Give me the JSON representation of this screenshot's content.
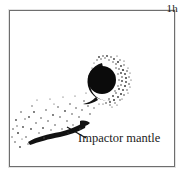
{
  "panel": {
    "kind": "impact-simulation-snapshot",
    "background_color": "#ffffff",
    "frame_color": "#6e6e6e",
    "ink_color": "#111111"
  },
  "time_label": {
    "text": "1h"
  },
  "annotation": {
    "label": "Impactor mantle",
    "leader_line": "points from the label up-left to the dark elongated streak"
  },
  "features": {
    "core": {
      "name": "target-core",
      "description": "solid black circular core",
      "cx": 92,
      "cy": 69,
      "r": 14,
      "color": "#0b0b0b"
    },
    "crescent": {
      "name": "core-crescent-arc",
      "description": "dark crescent hugging the left and lower-left of the core",
      "color": "#111111"
    },
    "halo": {
      "name": "stippled-halo",
      "description": "speckled mantle halo, denser on the right side of the core",
      "color": "#3a3a3a"
    },
    "streak": {
      "name": "impactor-mantle-streak",
      "description": "thick slightly curved dark band at lower left",
      "color": "#121212"
    },
    "debris": {
      "name": "debris-field",
      "description": "sparse scattered small dots spraying to the lower-left",
      "color": "#4a4a4a"
    }
  }
}
